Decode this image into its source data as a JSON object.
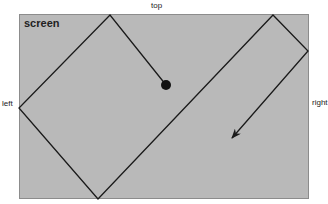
{
  "diagram": {
    "screen_label": "screen",
    "edge_labels": {
      "top": "top",
      "left": "left",
      "right": "right"
    },
    "colors": {
      "screen_fill": "#b9b9b9",
      "line": "#1a1a1a",
      "background": "#ffffff"
    },
    "path": {
      "description": "Ball trajectory bouncing off screen edges",
      "start_point": [
        166,
        85
      ],
      "vertices": [
        [
          166,
          85
        ],
        [
          110,
          15
        ],
        [
          19,
          108
        ],
        [
          98,
          199
        ],
        [
          273,
          15
        ],
        [
          308,
          51
        ],
        [
          232,
          138
        ]
      ],
      "end_marker": "arrow"
    }
  }
}
